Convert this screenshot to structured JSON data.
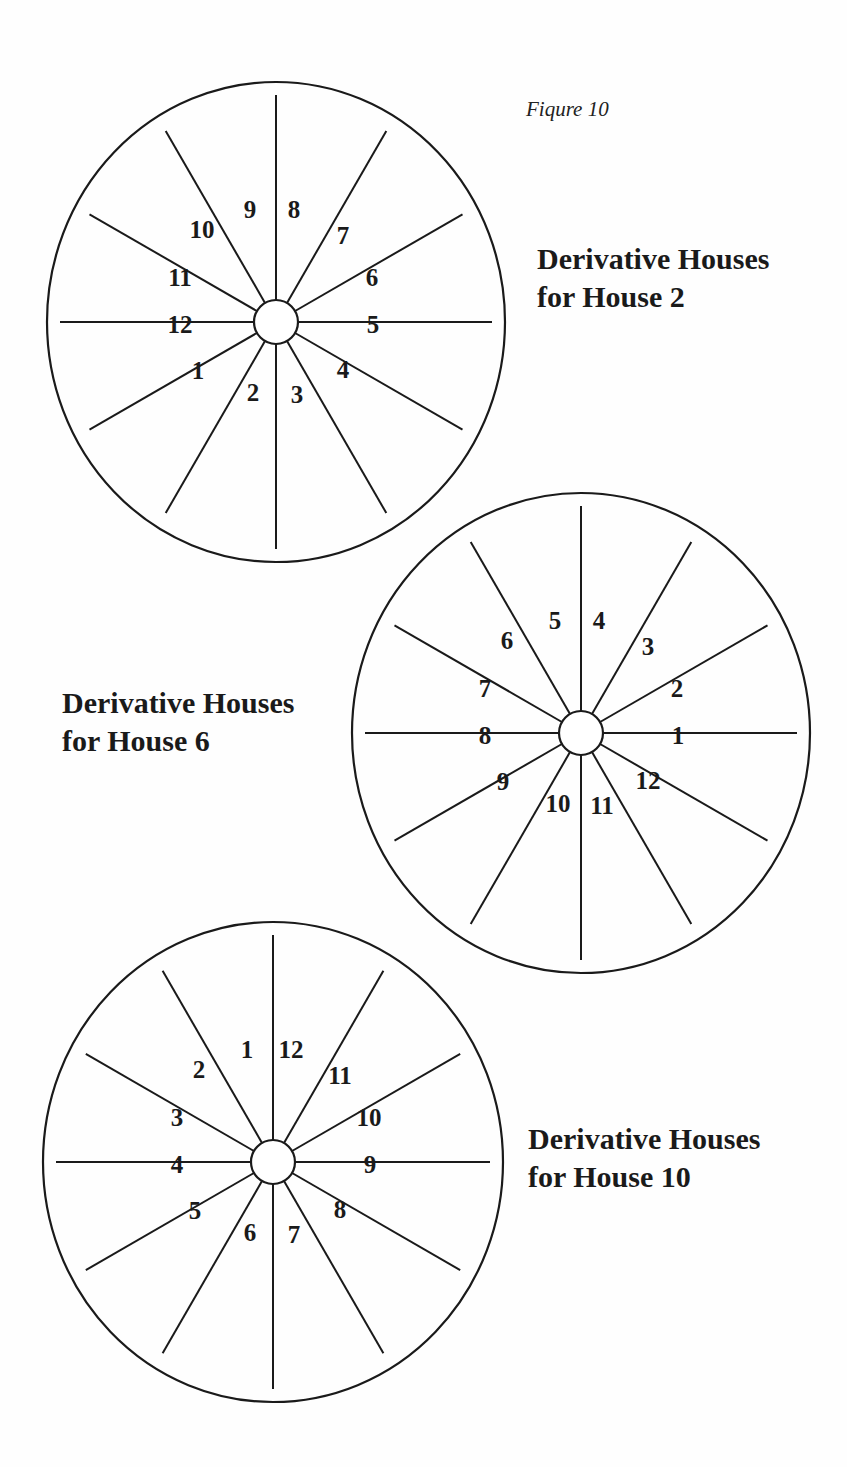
{
  "figure": {
    "caption": "Fiqure 10"
  },
  "wheels": [
    {
      "id": "house-2",
      "title_line1": "Derivative Houses",
      "title_line2": "for House 2",
      "center": [
        276,
        322
      ],
      "radius": [
        229,
        240
      ],
      "hub_radius": 22,
      "labels_clockwise_from_top_right": [
        "8",
        "7",
        "6",
        "5",
        "4",
        "3",
        "2",
        "1",
        "12",
        "11",
        "10",
        "9"
      ]
    },
    {
      "id": "house-6",
      "title_line1": "Derivative Houses",
      "title_line2": "for House 6",
      "center": [
        581,
        733
      ],
      "radius": [
        229,
        240
      ],
      "hub_radius": 22,
      "labels_clockwise_from_top_right": [
        "4",
        "3",
        "2",
        "1",
        "12",
        "11",
        "10",
        "9",
        "8",
        "7",
        "6",
        "5"
      ]
    },
    {
      "id": "house-10",
      "title_line1": "Derivative Houses",
      "title_line2": "for House 10",
      "center": [
        273,
        1162
      ],
      "radius": [
        230,
        240
      ],
      "hub_radius": 22,
      "labels_clockwise_from_top_right": [
        "12",
        "11",
        "10",
        "9",
        "8",
        "7",
        "6",
        "5",
        "4",
        "3",
        "2",
        "1"
      ]
    }
  ],
  "colors": {
    "stroke": "#1a1a1a",
    "background": "#ffffff"
  }
}
